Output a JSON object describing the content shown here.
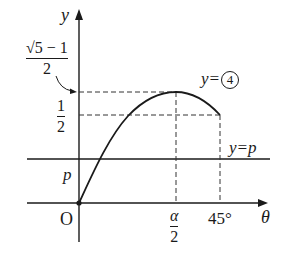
{
  "axes": {
    "y_label": "y",
    "x_label": "θ",
    "origin_label": "O"
  },
  "y_ticks": {
    "golden": {
      "numerator": "√5 − 1",
      "denominator": "2"
    },
    "half": {
      "numerator": "1",
      "denominator": "2"
    },
    "p": "p"
  },
  "x_ticks": {
    "alpha_half": {
      "numerator": "α",
      "denominator": "2"
    },
    "deg45": "45°"
  },
  "curves": {
    "curve_label_prefix": "y=",
    "curve_label_circled": "4",
    "line_label": "y=p"
  },
  "colors": {
    "ink": "#1a1a1a",
    "background": "#ffffff"
  }
}
